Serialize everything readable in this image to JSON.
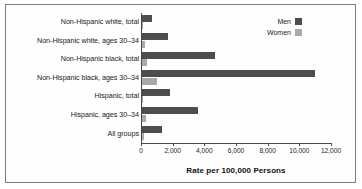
{
  "chart_data": {
    "type": "bar",
    "orientation": "horizontal",
    "title": "",
    "xlabel": "Rate per 100,000 Persons",
    "ylabel": "",
    "xlim": [
      0,
      12000
    ],
    "xticks": [
      "0",
      "2,000",
      "4,000",
      "6,000",
      "8,000",
      "10,000",
      "12,000"
    ],
    "xtick_values": [
      0,
      2000,
      4000,
      6000,
      8000,
      10000,
      12000
    ],
    "grid": false,
    "legend_position": "top-right",
    "categories": [
      "Non-Hispanic white, total",
      "Non-Hispanic white, ages 30–34",
      "Non-Hispanic black, total",
      "Non-Hispanic black, ages 30–34",
      "Hispanic, total",
      "Hispanic, ages 30–34",
      "All groups"
    ],
    "series": [
      {
        "name": "Men",
        "color": "#4d4d4d",
        "values": [
          700,
          1700,
          4700,
          11000,
          1800,
          3600,
          1350
        ]
      },
      {
        "name": "Women",
        "color": "#a9a9a9",
        "values": [
          120,
          250,
          350,
          1000,
          150,
          300,
          170
        ]
      }
    ]
  },
  "legend": {
    "items": [
      {
        "label": "Men",
        "color": "#4d4d4d"
      },
      {
        "label": "Women",
        "color": "#a9a9a9"
      }
    ]
  },
  "axis": {
    "title": "Rate per 100,000 Persons"
  }
}
